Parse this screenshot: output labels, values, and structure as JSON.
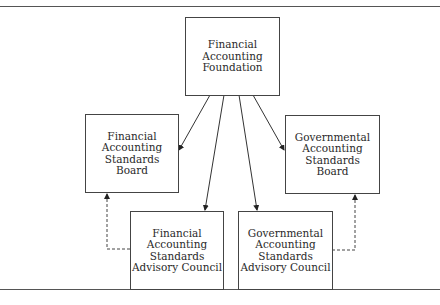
{
  "diagram": {
    "type": "organization-chart",
    "nodes": [
      {
        "id": "faf",
        "label": "Financial\nAccounting\nFoundation"
      },
      {
        "id": "fasb",
        "label": "Financial\nAccounting\nStandards\nBoard"
      },
      {
        "id": "gasb",
        "label": "Governmental\nAccounting\nStandards\nBoard"
      },
      {
        "id": "fasac",
        "label": "Financial\nAccounting\nStandards\nAdvisory Council"
      },
      {
        "id": "gasac",
        "label": "Governmental\nAccounting\nStandards\nAdvisory Council"
      }
    ],
    "edges": [
      {
        "from": "faf",
        "to": "fasb",
        "style": "solid"
      },
      {
        "from": "faf",
        "to": "fasac",
        "style": "solid"
      },
      {
        "from": "faf",
        "to": "gasac",
        "style": "solid"
      },
      {
        "from": "faf",
        "to": "gasb",
        "style": "solid"
      },
      {
        "from": "fasac",
        "to": "fasb",
        "style": "dashed"
      },
      {
        "from": "gasac",
        "to": "gasb",
        "style": "dashed"
      }
    ]
  }
}
